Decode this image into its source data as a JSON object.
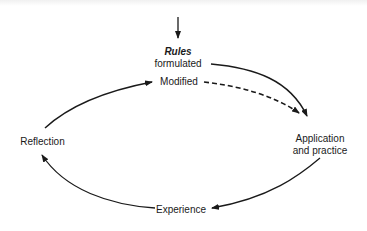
{
  "diagram": {
    "type": "cycle",
    "nodes": {
      "rules": {
        "title": "Rules",
        "subtitle": "formulated"
      },
      "modified": {
        "label": "Modified"
      },
      "application": {
        "line1": "Application",
        "line2": "and practice"
      },
      "experience": {
        "label": "Experience"
      },
      "reflection": {
        "label": "Reflection"
      }
    },
    "edges": [
      {
        "from": "entry",
        "to": "rules",
        "style": "solid"
      },
      {
        "from": "rules",
        "to": "application",
        "style": "solid"
      },
      {
        "from": "modified",
        "to": "application",
        "style": "dashed"
      },
      {
        "from": "application",
        "to": "experience",
        "style": "solid"
      },
      {
        "from": "experience",
        "to": "reflection",
        "style": "solid"
      },
      {
        "from": "reflection",
        "to": "modified",
        "style": "solid"
      }
    ],
    "colors": {
      "line": "#1a1a1a",
      "background": "#ffffff"
    }
  }
}
